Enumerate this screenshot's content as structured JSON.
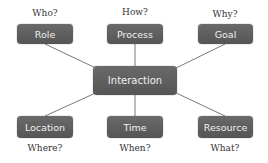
{
  "diagram": {
    "center": {
      "label": "Interaction"
    },
    "nodes": [
      {
        "label": "Role",
        "question": "Who?"
      },
      {
        "label": "Process",
        "question": "How?"
      },
      {
        "label": "Goal",
        "question": "Why?"
      },
      {
        "label": "Location",
        "question": "Where?"
      },
      {
        "label": "Time",
        "question": "When?"
      },
      {
        "label": "Resource",
        "question": "What?"
      }
    ],
    "colors": {
      "node_fill": "#5f5f5f",
      "node_text": "#f0f0f0",
      "connector": "#7a7a7a",
      "question_text": "#333333"
    }
  }
}
